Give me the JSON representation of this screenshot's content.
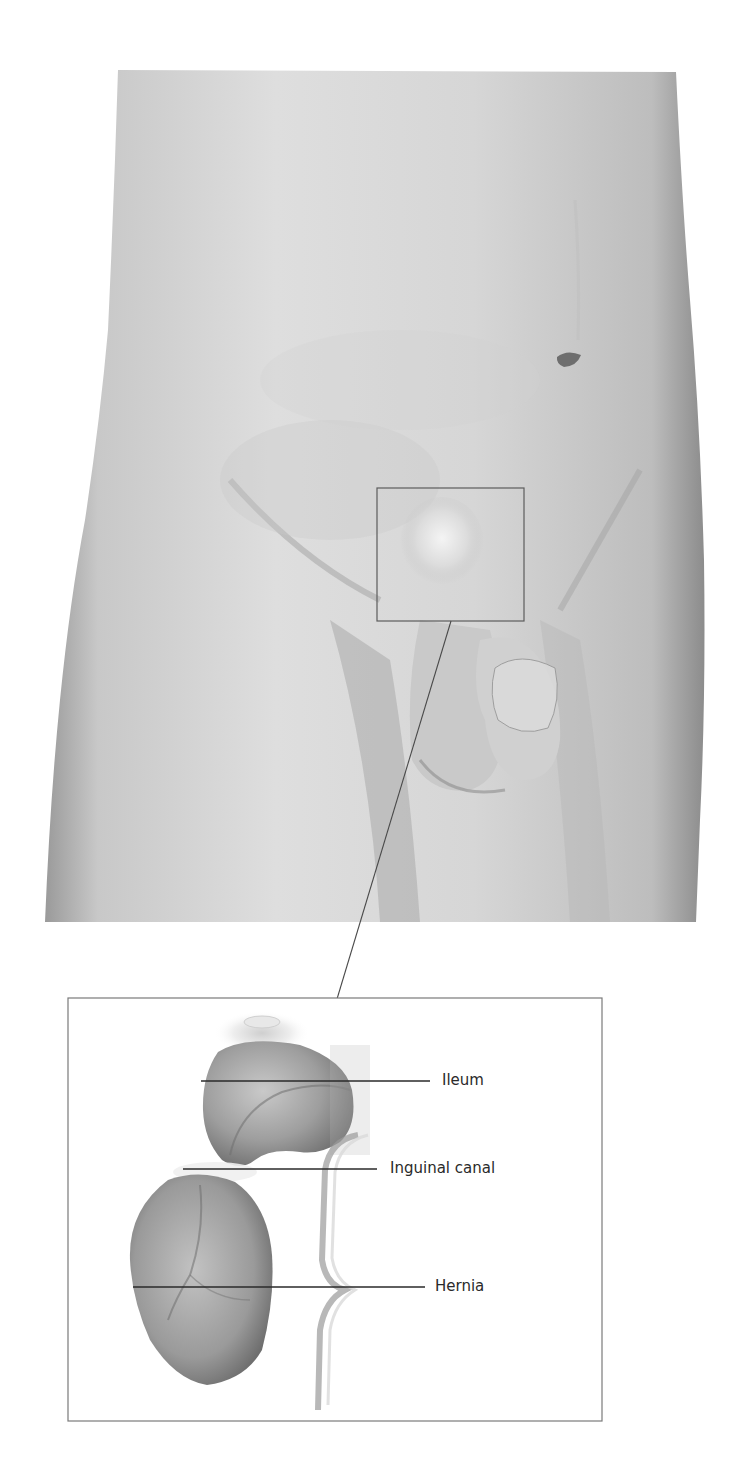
{
  "figure": {
    "type": "anatomical-illustration",
    "main_view": {
      "description": "Frontal view of male lower torso and upper thighs",
      "highlight_box": {
        "x": 377,
        "y": 488,
        "width": 147,
        "height": 133
      }
    },
    "inset": {
      "box": {
        "x": 68,
        "y": 998,
        "width": 534,
        "height": 423
      },
      "description": "Magnified view of highlighted region showing ileum protruding through inguinal canal",
      "labels": [
        {
          "id": "ileum",
          "text": "Ileum",
          "line_start_x": 201,
          "line_end_x": 430,
          "y": 1081
        },
        {
          "id": "inguinal-canal",
          "text": "Inguinal canal",
          "line_start_x": 183,
          "line_end_x": 377,
          "y": 1169
        },
        {
          "id": "hernia",
          "text": "Hernia",
          "line_start_x": 133,
          "line_end_x": 425,
          "y": 1287
        }
      ]
    },
    "connector": {
      "x1": 451,
      "y1": 621,
      "x2": 337,
      "y2": 999
    },
    "colors": {
      "skin_light": "#e6e6e6",
      "skin_mid": "#c4c4c4",
      "skin_dark": "#8f8f8f",
      "line": "#555555",
      "label_text": "#2a2a2a",
      "background": "#ffffff"
    }
  }
}
